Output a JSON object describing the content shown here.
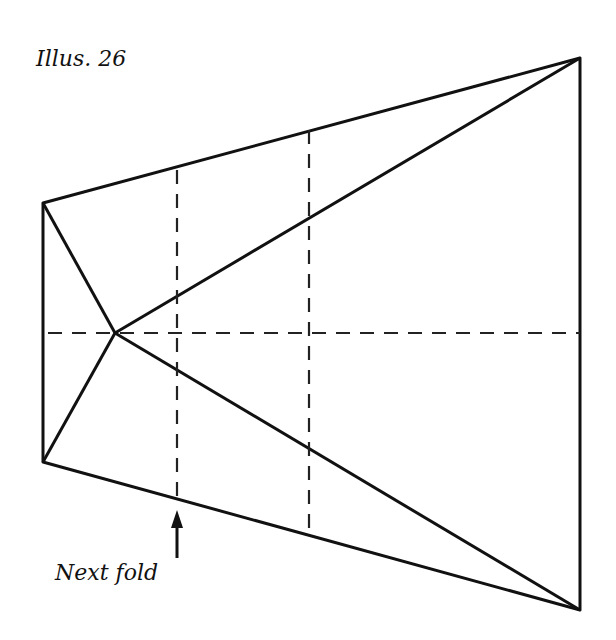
{
  "title": "Illus. 26",
  "annotation": {
    "label": "Next fold",
    "arrow": "up-arrow"
  },
  "diagram": {
    "type": "fold-diagram",
    "solid_outline": [
      [
        43,
        203
      ],
      [
        580,
        58
      ],
      [
        580,
        610
      ],
      [
        43,
        462
      ]
    ],
    "center_point": [
      115,
      333
    ],
    "solid_lines": [
      [
        [
          43,
          203
        ],
        [
          115,
          333
        ]
      ],
      [
        [
          43,
          462
        ],
        [
          115,
          333
        ]
      ],
      [
        [
          115,
          333
        ],
        [
          580,
          58
        ]
      ],
      [
        [
          115,
          333
        ],
        [
          580,
          610
        ]
      ]
    ],
    "dashed_lines": [
      [
        [
          48,
          333
        ],
        [
          580,
          333
        ]
      ],
      [
        [
          177,
          170
        ],
        [
          177,
          496
        ]
      ],
      [
        [
          309,
          130
        ],
        [
          309,
          530
        ]
      ]
    ],
    "colors": {
      "line": "#111111",
      "background": "#ffffff"
    }
  }
}
